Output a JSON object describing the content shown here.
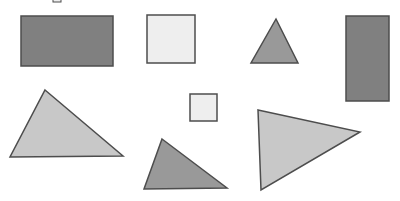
{
  "figure": {
    "canvas": {
      "width": 400,
      "height": 201,
      "background": "#ffffff"
    },
    "palette": {
      "dark_gray_fill": "#808080",
      "medium_gray_fill": "#999999",
      "light_gray_fill": "#c8c8c8",
      "near_white_fill": "#eeeeee",
      "outline": "#4d4d4d",
      "background": "#ffffff"
    },
    "shape_count": 8,
    "shapes": [
      {
        "id": "clipped-square-fragment",
        "name": "clipped-square-fragment",
        "kind": "rectangle",
        "label": "tiny square clipped at top edge",
        "fill": "#eeeeee",
        "stroke": "#4d4d4d",
        "stroke_width": 1,
        "x": 53,
        "y": -6,
        "width": 8,
        "height": 8
      },
      {
        "id": "large-dark-rectangle",
        "name": "large-dark-rectangle",
        "kind": "rectangle",
        "label": "large dark gray rectangle",
        "fill": "#808080",
        "stroke": "#4d4d4d",
        "stroke_width": 1.5,
        "x": 21,
        "y": 16,
        "width": 92,
        "height": 50
      },
      {
        "id": "light-square-top",
        "name": "light-square-top",
        "kind": "rectangle",
        "label": "large near-white square",
        "fill": "#eeeeee",
        "stroke": "#4d4d4d",
        "stroke_width": 1.5,
        "x": 147,
        "y": 15,
        "width": 48,
        "height": 48
      },
      {
        "id": "small-gray-triangle-top",
        "name": "small-gray-triangle-top",
        "kind": "triangle",
        "label": "small medium-gray upward triangle",
        "fill": "#999999",
        "stroke": "#4d4d4d",
        "stroke_width": 1.5,
        "points": "276,19 298,63 251,63"
      },
      {
        "id": "tall-dark-rectangle",
        "name": "tall-dark-rectangle",
        "kind": "rectangle",
        "label": "tall dark gray rectangle",
        "fill": "#808080",
        "stroke": "#4d4d4d",
        "stroke_width": 1.5,
        "x": 346,
        "y": 16,
        "width": 43,
        "height": 85
      },
      {
        "id": "large-light-triangle-left",
        "name": "large-light-triangle-left",
        "kind": "triangle",
        "label": "large light gray triangle, apex upper-left",
        "fill": "#c8c8c8",
        "stroke": "#4d4d4d",
        "stroke_width": 1.5,
        "points": "45,90 123,156 10,157"
      },
      {
        "id": "small-light-square-center",
        "name": "small-light-square-center",
        "kind": "rectangle",
        "label": "small near-white square",
        "fill": "#eeeeee",
        "stroke": "#4d4d4d",
        "stroke_width": 1.5,
        "x": 190,
        "y": 94,
        "width": 27,
        "height": 27
      },
      {
        "id": "medium-gray-triangle-bottom",
        "name": "medium-gray-triangle-bottom",
        "kind": "triangle",
        "label": "medium gray triangle, apex upper-left",
        "fill": "#999999",
        "stroke": "#4d4d4d",
        "stroke_width": 1.5,
        "points": "162,139 227,188 144,189"
      },
      {
        "id": "large-light-triangle-right",
        "name": "large-light-triangle-right",
        "kind": "triangle",
        "label": "large light gray right-pointing triangle",
        "fill": "#c8c8c8",
        "stroke": "#4d4d4d",
        "stroke_width": 1.5,
        "points": "258,110 360,132 261,190"
      }
    ]
  }
}
